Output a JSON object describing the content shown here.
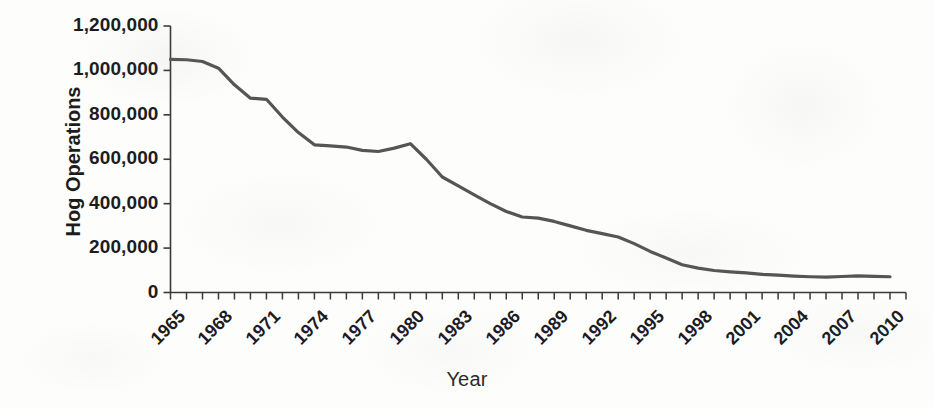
{
  "chart_data": {
    "type": "line",
    "title": "",
    "xlabel": "Year",
    "ylabel": "Hog Operations",
    "xlim": [
      1965,
      2011
    ],
    "ylim": [
      0,
      1200000
    ],
    "grid": false,
    "legend": "none",
    "line_color": "#555555",
    "text_color": "#1c1c1c",
    "background_color": "#fdfdfc",
    "y_ticks": [
      0,
      200000,
      400000,
      600000,
      800000,
      1000000,
      1200000
    ],
    "y_tick_labels": [
      "0",
      "200,000",
      "400,000",
      "600,000",
      "800,000",
      "1,000,000",
      "1,200,000"
    ],
    "x_ticks_minor_every": 1,
    "x_tick_labels": [
      "1965",
      "1968",
      "1971",
      "1974",
      "1977",
      "1980",
      "1983",
      "1986",
      "1989",
      "1992",
      "1995",
      "1998",
      "2001",
      "2004",
      "2007",
      "2010"
    ],
    "x_tick_label_rotation": -45,
    "x": [
      1965,
      1966,
      1967,
      1968,
      1969,
      1970,
      1971,
      1972,
      1973,
      1974,
      1975,
      1976,
      1977,
      1978,
      1979,
      1980,
      1981,
      1982,
      1983,
      1984,
      1985,
      1986,
      1987,
      1988,
      1989,
      1990,
      1991,
      1992,
      1993,
      1994,
      1995,
      1996,
      1997,
      1998,
      1999,
      2000,
      2001,
      2002,
      2003,
      2004,
      2005,
      2006,
      2007,
      2008,
      2009,
      2010
    ],
    "values": [
      1050000,
      1048000,
      1040000,
      1010000,
      935000,
      875000,
      870000,
      790000,
      720000,
      665000,
      660000,
      655000,
      640000,
      635000,
      650000,
      670000,
      600000,
      520000,
      480000,
      440000,
      400000,
      365000,
      340000,
      335000,
      320000,
      300000,
      280000,
      265000,
      250000,
      220000,
      185000,
      155000,
      125000,
      110000,
      99000,
      93000,
      88000,
      82000,
      78000,
      74000,
      71000,
      69000,
      72000,
      75000,
      73000,
      71000
    ],
    "annotations": []
  }
}
